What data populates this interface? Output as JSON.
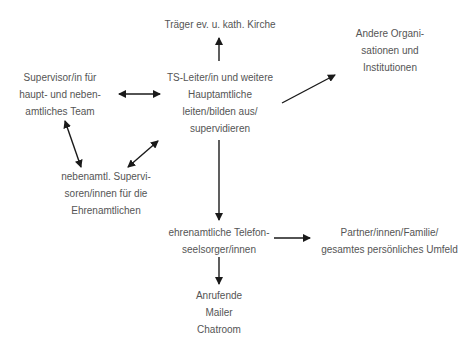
{
  "diagram": {
    "nodes": {
      "traeger": {
        "lines": [
          "Träger ev. u. kath. Kirche"
        ]
      },
      "andere": {
        "lines": [
          "Andere Organi-",
          "sationen und",
          "Institutionen"
        ]
      },
      "supervisor_team": {
        "lines": [
          "Supervisor/in für",
          "haupt- und neben-",
          "amtliches Team"
        ]
      },
      "ts_leiter": {
        "lines": [
          "TS-Leiter/in und weitere",
          "Hauptamtliche",
          "leiten/bilden aus/",
          "supervidieren"
        ]
      },
      "nebenamtl": {
        "lines": [
          "nebenamtl. Supervi-",
          "soren/innen für die",
          "Ehrenamtlichen"
        ]
      },
      "ehrenamtliche": {
        "lines": [
          "ehrenamtliche Telefon-",
          "seelsorger/innen"
        ]
      },
      "partner": {
        "lines": [
          "Partner/innen/Familie/",
          "gesamtes persönliches Umfeld"
        ]
      },
      "anrufende": {
        "lines": [
          "Anrufende",
          "Mailer",
          "Chatroom"
        ]
      }
    },
    "edges": [
      {
        "from": "ts_leiter",
        "to": "traeger",
        "type": "directed"
      },
      {
        "from": "ts_leiter",
        "to": "andere",
        "type": "directed"
      },
      {
        "from": "supervisor_team",
        "to": "ts_leiter",
        "type": "bidirectional"
      },
      {
        "from": "supervisor_team",
        "to": "nebenamtl",
        "type": "bidirectional"
      },
      {
        "from": "nebenamtl",
        "to": "ts_leiter",
        "type": "bidirectional"
      },
      {
        "from": "ts_leiter",
        "to": "ehrenamtliche",
        "type": "directed"
      },
      {
        "from": "ehrenamtliche",
        "to": "partner",
        "type": "directed"
      },
      {
        "from": "ehrenamtliche",
        "to": "anrufende",
        "type": "directed"
      }
    ],
    "colors": {
      "text": "#555555",
      "arrow": "#1a1a1a",
      "background": "#ffffff"
    }
  }
}
